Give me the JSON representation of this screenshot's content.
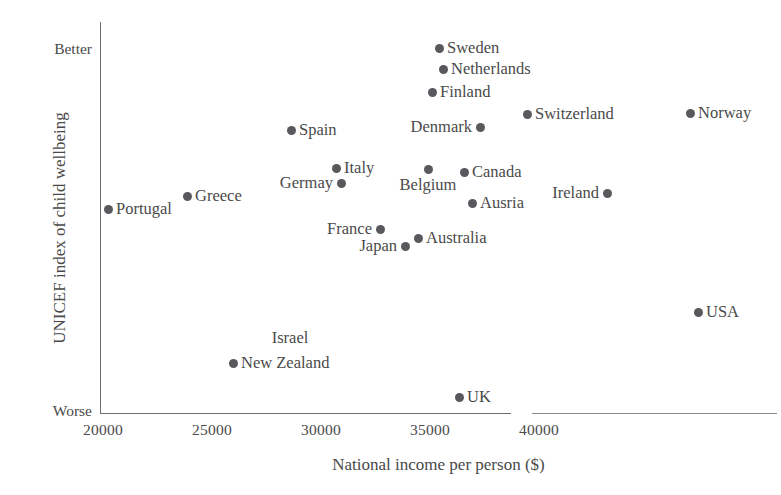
{
  "chart_data": {
    "type": "scatter",
    "title": "",
    "xlabel": "National income per person ($)",
    "ylabel": "UNICEF index of child wellbeing",
    "xlim": [
      19200,
      42500
    ],
    "ylim": [
      0,
      100
    ],
    "grid": false,
    "legend": "none",
    "x_ticks": [
      "20000",
      "25000",
      "30000",
      "35000",
      "40000"
    ],
    "x_tick_values": [
      20000,
      25000,
      30000,
      35000,
      40000
    ],
    "y_axis_endcaps": {
      "top": "Better",
      "bottom": "Worse"
    },
    "y_tick_labels": [
      "Worse",
      "Better"
    ],
    "axis_break_note": "x-axis line has a small visible break near 35400",
    "points": [
      {
        "label": "Sweden",
        "x": 35500,
        "y": 100.0,
        "px": 439,
        "py": 48,
        "label_pos": "right"
      },
      {
        "label": "Netherlands",
        "x": 35700,
        "y": 94.2,
        "px": 443,
        "py": 69,
        "label_pos": "right"
      },
      {
        "label": "Finland",
        "x": 34200,
        "y": 87.8,
        "px": 432,
        "py": 92,
        "label_pos": "right"
      },
      {
        "label": "Switzerland",
        "x": 38300,
        "y": 84.3,
        "px": 527,
        "py": 114,
        "label_pos": "right"
      },
      {
        "label": "Norway",
        "x": 46900,
        "y": 84.0,
        "px": 690,
        "py": 113,
        "label_pos": "right"
      },
      {
        "label": "Denmark",
        "x": 37400,
        "y": 78.2,
        "px": 480,
        "py": 127,
        "label_pos": "left"
      },
      {
        "label": "Spain",
        "x": 28700,
        "y": 77.3,
        "px": 291,
        "py": 130,
        "label_pos": "right"
      },
      {
        "label": "Italy",
        "x": 31300,
        "y": 66.9,
        "px": 336,
        "py": 168,
        "label_pos": "right"
      },
      {
        "label": "Belgium",
        "x": 34600,
        "y": 66.6,
        "px": 428,
        "py": 169,
        "label_pos": "below"
      },
      {
        "label": "Canada",
        "x": 36600,
        "y": 65.7,
        "px": 464,
        "py": 172,
        "label_pos": "right"
      },
      {
        "label": "Germay",
        "x": 31600,
        "y": 62.7,
        "px": 341,
        "py": 183,
        "label_pos": "left"
      },
      {
        "label": "Ireland",
        "x": 43200,
        "y": 60.0,
        "px": 607,
        "py": 193,
        "label_pos": "left"
      },
      {
        "label": "Greece",
        "x": 23800,
        "y": 59.1,
        "px": 187,
        "py": 196,
        "label_pos": "right"
      },
      {
        "label": "Ausria",
        "x": 36900,
        "y": 57.1,
        "px": 472,
        "py": 203,
        "label_pos": "right"
      },
      {
        "label": "Portugal",
        "x": 20200,
        "y": 55.4,
        "px": 108,
        "py": 209,
        "label_pos": "right"
      },
      {
        "label": "France",
        "x": 32800,
        "y": 49.8,
        "px": 380,
        "py": 229,
        "label_pos": "left"
      },
      {
        "label": "Australia",
        "x": 34500,
        "y": 47.4,
        "px": 418,
        "py": 238,
        "label_pos": "right"
      },
      {
        "label": "Japan",
        "x": 33900,
        "y": 45.1,
        "px": 405,
        "py": 246,
        "label_pos": "left"
      },
      {
        "label": "USA",
        "x": 46300,
        "y": 26.9,
        "px": 698,
        "py": 312,
        "label_pos": "right"
      },
      {
        "label": "New Zealand",
        "x": 25700,
        "y": 12.9,
        "px": 233,
        "py": 363,
        "label_pos": "right"
      },
      {
        "label": "UK",
        "x": 35000,
        "y": 0.8,
        "px": 459,
        "py": 397,
        "label_pos": "right"
      }
    ],
    "unmarked_labels": [
      {
        "label": "Israel",
        "px": 290,
        "py": 330
      }
    ]
  }
}
